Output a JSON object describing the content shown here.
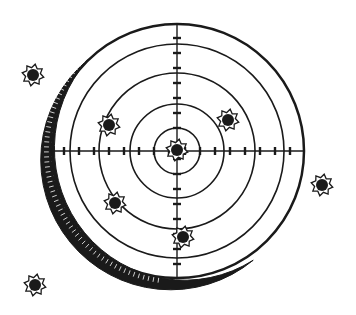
{
  "colors": {
    "ink": "#1a1a1a",
    "paper": "#ffffff"
  },
  "target": {
    "center": [
      177,
      151
    ],
    "rings": [
      23,
      47,
      78,
      107
    ],
    "outer_radius": 127
  },
  "bullet_holes": [
    {
      "x": 33,
      "y": 75,
      "location": "outside"
    },
    {
      "x": 109,
      "y": 125,
      "location": "ring-3"
    },
    {
      "x": 228,
      "y": 120,
      "location": "ring-3"
    },
    {
      "x": 177,
      "y": 150,
      "location": "bullseye"
    },
    {
      "x": 115,
      "y": 203,
      "location": "ring-3"
    },
    {
      "x": 183,
      "y": 237,
      "location": "ring-3"
    },
    {
      "x": 322,
      "y": 185,
      "location": "outside"
    },
    {
      "x": 35,
      "y": 285,
      "location": "outside"
    }
  ]
}
